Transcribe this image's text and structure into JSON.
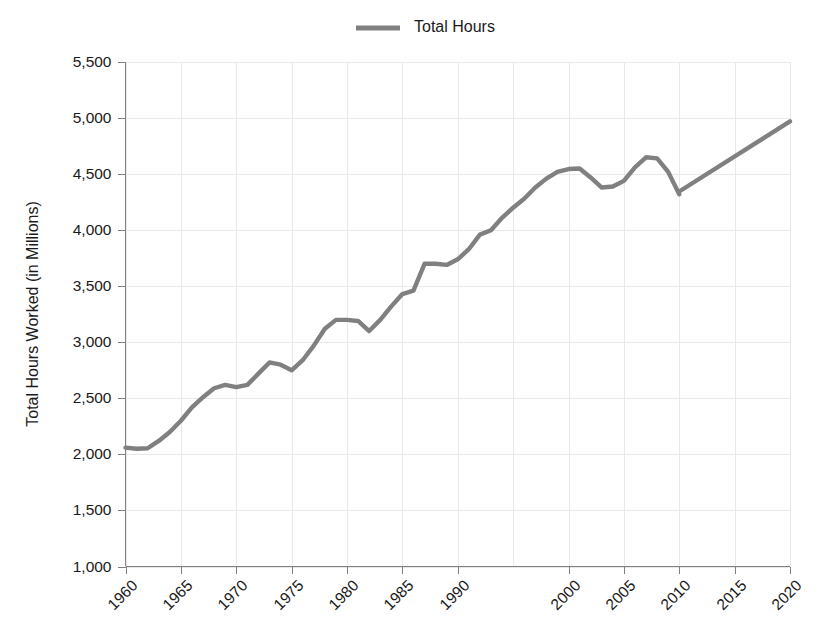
{
  "legend": {
    "position": "top-center",
    "entries": [
      {
        "label": "Total Hours",
        "color": "#808080",
        "marker": "line-swatch"
      }
    ]
  },
  "axes": {
    "y_title": "Total Hours Worked (in Millions)",
    "x_title": "",
    "y_ticks": [
      "1,000",
      "1,500",
      "2,000",
      "2,500",
      "3,000",
      "3,500",
      "4,000",
      "4,500",
      "5,000",
      "5,500"
    ],
    "x_ticks": [
      "1960",
      "1965",
      "1970",
      "1975",
      "1980",
      "1985",
      "1990",
      "2000",
      "2005",
      "2010",
      "2015",
      "2020"
    ]
  },
  "style": {
    "line_color": "#808080",
    "grid_color": "#e9e9e9",
    "axis_color": "#808080",
    "text_color": "#1a1a1a",
    "background": "#ffffff"
  },
  "chart_data": {
    "type": "line",
    "title": "",
    "xlabel": "",
    "ylabel": "Total Hours Worked (in Millions)",
    "xlim": [
      1960,
      2020
    ],
    "ylim": [
      1000,
      5500
    ],
    "ytick_values": [
      1000,
      1500,
      2000,
      2500,
      3000,
      3500,
      4000,
      4500,
      5000,
      5500
    ],
    "xtick_values": [
      1960,
      1965,
      1970,
      1975,
      1980,
      1985,
      1990,
      2000,
      2005,
      2010,
      2015,
      2020
    ],
    "grid": true,
    "legend_position": "top-center",
    "series": [
      {
        "name": "Total Hours",
        "color": "#808080",
        "segments": [
          {
            "name": "historical",
            "x": [
              1960,
              1961,
              1962,
              1963,
              1964,
              1965,
              1966,
              1967,
              1968,
              1969,
              1970,
              1971,
              1972,
              1973,
              1974,
              1975,
              1976,
              1977,
              1978,
              1979,
              1980,
              1981,
              1982,
              1983,
              1984,
              1985,
              1986,
              1987,
              1988,
              1989,
              1990,
              1991,
              1992,
              1993,
              1994,
              1995,
              1996,
              1997,
              1998,
              1999,
              2000,
              2001,
              2002,
              2003,
              2004,
              2005,
              2006,
              2007,
              2008,
              2009,
              2010
            ],
            "y": [
              2060,
              2050,
              2055,
              2120,
              2200,
              2300,
              2420,
              2510,
              2590,
              2620,
              2600,
              2620,
              2720,
              2820,
              2800,
              2750,
              2840,
              2970,
              3120,
              3200,
              3200,
              3190,
              3100,
              3200,
              3320,
              3430,
              3460,
              3700,
              3700,
              3690,
              3740,
              3830,
              3960,
              4000,
              4110,
              4200,
              4280,
              4380,
              4460,
              4520,
              4545,
              4550,
              4470,
              4380,
              4390,
              4440,
              4560,
              4650,
              4640,
              4520,
              4320
            ]
          },
          {
            "name": "projected",
            "x": [
              2010,
              2020
            ],
            "y": [
              4345,
              4970
            ]
          }
        ]
      }
    ]
  }
}
